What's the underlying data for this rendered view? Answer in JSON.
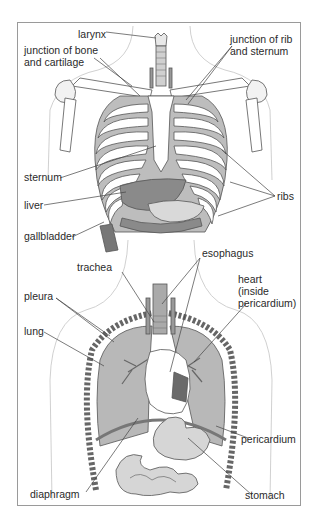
{
  "diagram": {
    "panels": [
      {
        "id": "rib-cage",
        "labels": {
          "larynx": "larynx",
          "junction_bone_cartilage": "junction of bone\nand cartilage",
          "junction_rib_sternum": "junction of rib\nand sternum",
          "sternum": "sternum",
          "liver": "liver",
          "gallbladder": "gallbladder",
          "ribs": "ribs"
        }
      },
      {
        "id": "thoracic-organs",
        "labels": {
          "trachea": "trachea",
          "esophagus": "esophagus",
          "heart": "heart\n(inside\npericardium)",
          "pleura": "pleura",
          "lung": "lung",
          "pericardium": "pericardium",
          "diaphragm": "diaphragm",
          "stomach": "stomach"
        }
      }
    ],
    "colors": {
      "frame": "#9a9a9a",
      "outline": "#555555",
      "body_outline": "#bdbdbd",
      "cartilage": "#a9a9a9",
      "bone": "#ffffff",
      "lung": "#bcbcbc",
      "organ": "#d4d4d4",
      "dark_organ": "#6e6e6e",
      "leader": "#444444"
    }
  }
}
